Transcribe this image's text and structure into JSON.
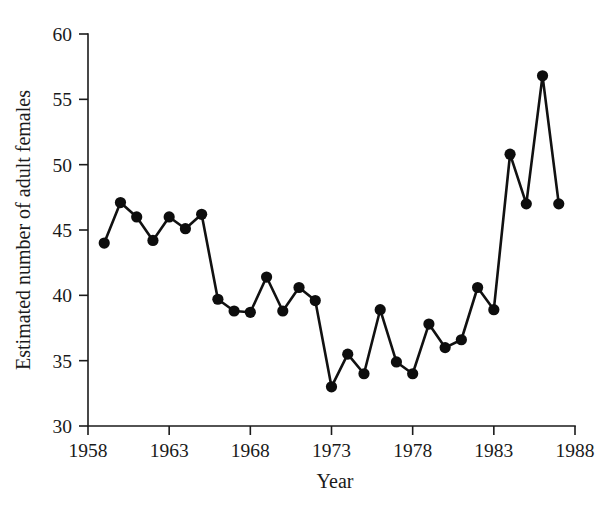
{
  "chart_data": {
    "type": "line",
    "title": "",
    "xlabel": "Year",
    "ylabel": "Estimated number of adult females",
    "xlim": [
      1958,
      1988
    ],
    "ylim": [
      30,
      60
    ],
    "grid": false,
    "legend": "none",
    "marker": "filled-circle",
    "line_color": "#111111",
    "marker_color": "#0d0d0d",
    "background_color": "#ffffff",
    "xticks": [
      1958,
      1963,
      1968,
      1973,
      1978,
      1983,
      1988
    ],
    "xtick_labels": [
      "1958",
      "1963",
      "1968",
      "1973",
      "1978",
      "1983",
      "1988"
    ],
    "yticks": [
      30,
      35,
      40,
      45,
      50,
      55,
      60
    ],
    "ytick_labels": [
      "30",
      "35",
      "40",
      "45",
      "50",
      "55",
      "60"
    ],
    "x": [
      1959,
      1960,
      1961,
      1962,
      1963,
      1964,
      1965,
      1966,
      1967,
      1968,
      1969,
      1970,
      1971,
      1972,
      1973,
      1974,
      1975,
      1976,
      1977,
      1978,
      1979,
      1980,
      1981,
      1982,
      1983,
      1984,
      1985,
      1986,
      1987
    ],
    "values": [
      44.0,
      47.1,
      46.0,
      44.2,
      46.0,
      45.1,
      46.2,
      39.7,
      38.8,
      38.7,
      41.4,
      38.8,
      40.6,
      39.6,
      33.0,
      35.5,
      34.0,
      38.9,
      34.9,
      34.0,
      37.8,
      36.0,
      36.6,
      40.6,
      38.9,
      50.8,
      47.0,
      56.8,
      47.0
    ],
    "series": [
      {
        "name": "Estimated number of adult females",
        "values": [
          44.0,
          47.1,
          46.0,
          44.2,
          46.0,
          45.1,
          46.2,
          39.7,
          38.8,
          38.7,
          41.4,
          38.8,
          40.6,
          39.6,
          33.0,
          35.5,
          34.0,
          38.9,
          34.9,
          34.0,
          37.8,
          36.0,
          36.6,
          40.6,
          38.9,
          50.8,
          47.0,
          56.8,
          47.0
        ]
      }
    ]
  }
}
